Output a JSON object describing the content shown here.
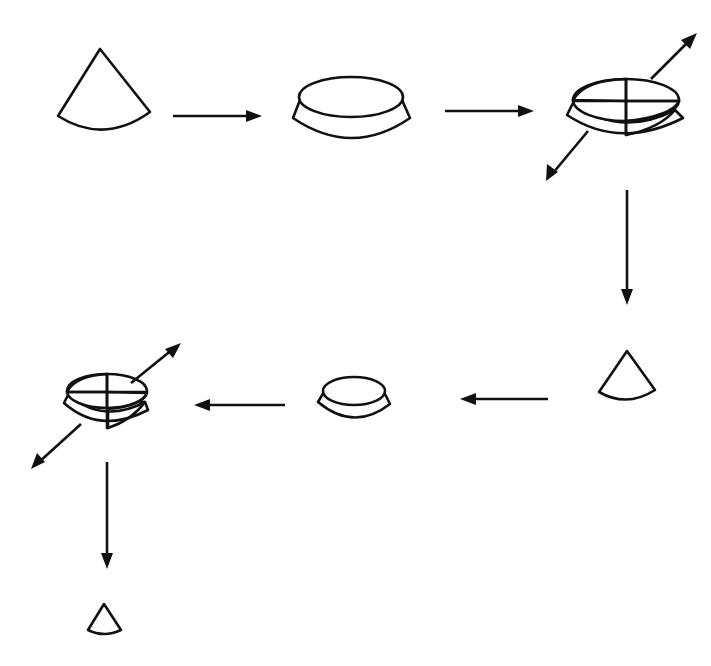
{
  "diagram": {
    "title": "",
    "colors": {
      "ink": "#111111",
      "background": "#ffffff"
    },
    "steps": [
      {
        "id": "cone-1",
        "shape": "cone",
        "size": "large"
      },
      {
        "id": "flatten-1",
        "shape": "flattened-cone"
      },
      {
        "id": "quarter-1",
        "shape": "quartered-pile",
        "opposite_quarters_removed": true
      },
      {
        "id": "cone-2",
        "shape": "cone",
        "size": "medium"
      },
      {
        "id": "flatten-2",
        "shape": "flattened-cone"
      },
      {
        "id": "quarter-2",
        "shape": "quartered-pile",
        "opposite_quarters_removed": true
      },
      {
        "id": "cone-3",
        "shape": "cone",
        "size": "small"
      }
    ],
    "flow": [
      "cone-1 → flatten-1",
      "flatten-1 → quarter-1",
      "quarter-1 → cone-2",
      "cone-2 → flatten-2",
      "flatten-2 → quarter-2",
      "quarter-2 → cone-3"
    ]
  }
}
